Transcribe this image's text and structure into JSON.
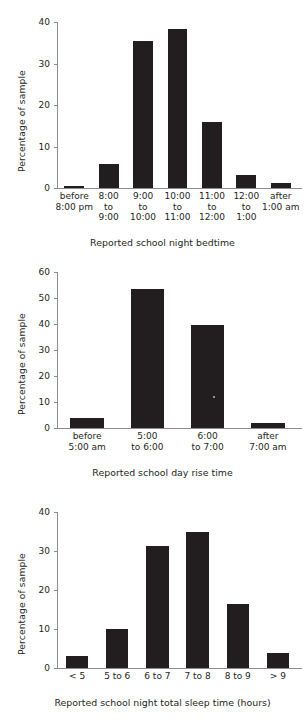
{
  "figure": {
    "background_color": "#ffffff",
    "bar_color": "#221e1f",
    "axis_color": "#8c8c8c",
    "text_color": "#231f20"
  },
  "chart_data": [
    {
      "type": "bar",
      "title": "",
      "xlabel": "Reported school night bedtime",
      "ylabel": "Percentage of sample",
      "ylim": [
        0,
        40
      ],
      "yticks": [
        0,
        10,
        20,
        30,
        40
      ],
      "ytick_labels": [
        "0",
        "10",
        "20",
        "30",
        "40"
      ],
      "grid": false,
      "legend": "none",
      "categories": [
        "before\n8:00 pm",
        "8:00\nto\n9:00",
        "9:00\nto\n10:00",
        "10:00\nto\n11:00",
        "11:00\nto\n12:00",
        "12:00\nto\n1:00",
        "after\n1:00 am"
      ],
      "values": [
        0.6,
        5.7,
        35.5,
        38.2,
        15.8,
        3.1,
        1.2
      ]
    },
    {
      "type": "bar",
      "title": "",
      "xlabel": "Reported school day rise time",
      "ylabel": "Percentage of sample",
      "ylim": [
        0,
        60
      ],
      "yticks": [
        0,
        10,
        20,
        30,
        40,
        50,
        60
      ],
      "ytick_labels": [
        "0",
        "10",
        "20",
        "30",
        "40",
        "50",
        "60"
      ],
      "grid": false,
      "legend": "none",
      "categories": [
        "before\n5:00 am",
        "5:00\nto 6:00",
        "6:00\nto 7:00",
        "after\n7:00 am"
      ],
      "values": [
        3.9,
        53.5,
        39.5,
        2.1
      ]
    },
    {
      "type": "bar",
      "title": "",
      "xlabel": "Reported school night total sleep time (hours)",
      "ylabel": "Percentage of sample",
      "ylim": [
        0,
        40
      ],
      "yticks": [
        0,
        10,
        20,
        30,
        40
      ],
      "ytick_labels": [
        "0",
        "10",
        "20",
        "30",
        "40"
      ],
      "grid": false,
      "legend": "none",
      "categories": [
        "< 5",
        "5 to 6",
        "6 to 7",
        "7 to 8",
        "8 to 9",
        "> 9"
      ],
      "values": [
        3.0,
        10.1,
        31.3,
        35.0,
        16.4,
        3.9
      ]
    }
  ]
}
